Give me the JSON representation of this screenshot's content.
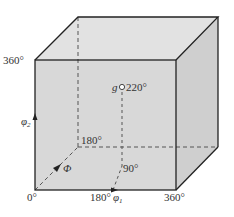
{
  "diagram": {
    "colors": {
      "face_front": "#d8d8d8",
      "face_top": "#e2e2e2",
      "face_side": "#cfcfcf",
      "edge": "#222222",
      "dashed": "#555555",
      "background": "#ffffff"
    },
    "labels": {
      "origin": "0°",
      "phi1_mid": "180°",
      "phi1_max": "360°",
      "phi2_max": "360°",
      "phi_mid": "180°",
      "phi_inner": "90°",
      "g_point": "g",
      "g_value": "220°"
    },
    "axes": {
      "phi1": {
        "symbol": "φ",
        "subscript": "1"
      },
      "phi2": {
        "symbol": "φ",
        "subscript": "2"
      },
      "phi": {
        "symbol": "Φ"
      }
    }
  }
}
